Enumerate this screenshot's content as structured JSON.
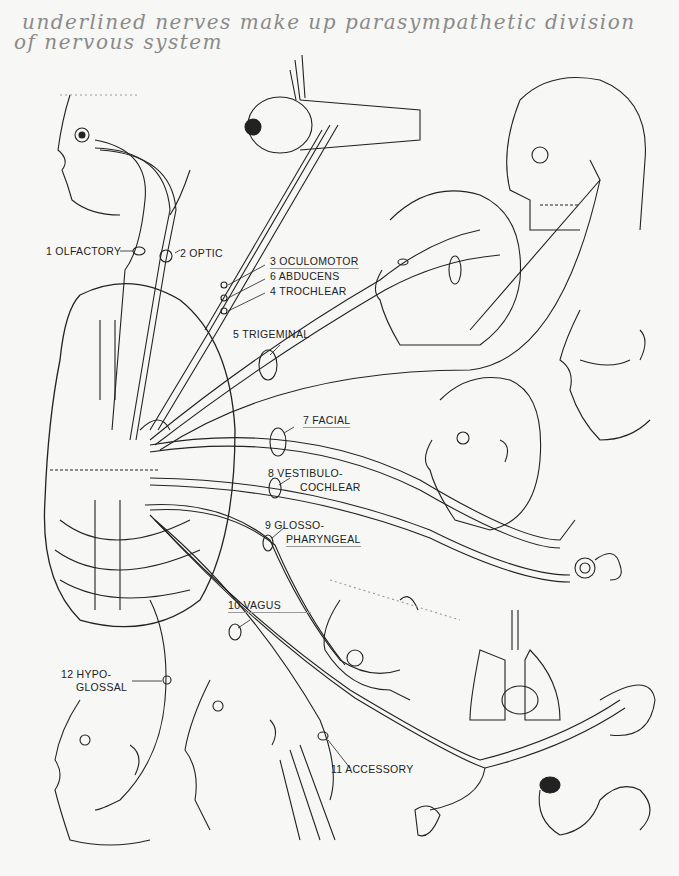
{
  "handwritten_note": {
    "line1": "underlined nerves make up parasympathetic division",
    "line2": "of nervous system",
    "color": "#8a8a8a"
  },
  "diagram": {
    "central_structure": "brain-inferior-view",
    "ink_color": "#222222",
    "background": "#f7f7f5"
  },
  "nerves": [
    {
      "number": "1",
      "name": "OLFACTORY",
      "label": "1 OLFACTORY",
      "underlined": false,
      "target": "nose"
    },
    {
      "number": "2",
      "name": "OPTIC",
      "label": "2 OPTIC",
      "underlined": false,
      "target": "eye"
    },
    {
      "number": "3",
      "name": "OCULOMOTOR",
      "label": "3 OCULOMOTOR",
      "underlined": true,
      "target": "eye-muscles"
    },
    {
      "number": "6",
      "name": "ABDUCENS",
      "label": "6 ABDUCENS",
      "underlined": false,
      "target": "eye-muscles"
    },
    {
      "number": "4",
      "name": "TROCHLEAR",
      "label": "4 TROCHLEAR",
      "underlined": false,
      "target": "eye-muscles"
    },
    {
      "number": "5",
      "name": "TRIGEMINAL",
      "label": "5 TRIGEMINAL",
      "underlined": false,
      "target": "face-jaw"
    },
    {
      "number": "7",
      "name": "FACIAL",
      "label": "7 FACIAL",
      "underlined": true,
      "target": "facial-muscles"
    },
    {
      "number": "8",
      "name": "VESTIBULOCOCHLEAR",
      "label_line1": "8 VESTIBULO-",
      "label_line2": "COCHLEAR",
      "underlined": false,
      "target": "inner-ear"
    },
    {
      "number": "9",
      "name": "GLOSSOPHARYNGEAL",
      "label_line1": "9 GLOSSO-",
      "label_line2": "PHARYNGEAL",
      "underlined": true,
      "target": "tongue-pharynx"
    },
    {
      "number": "10",
      "name": "VAGUS",
      "label": "10 VAGUS",
      "underlined": true,
      "target": "thoracic-abdominal-organs"
    },
    {
      "number": "11",
      "name": "ACCESSORY",
      "label": "11 ACCESSORY",
      "underlined": false,
      "target": "neck-muscles"
    },
    {
      "number": "12",
      "name": "HYPOGLOSSAL",
      "label_line1": "12 HYPO-",
      "label_line2": "GLOSSAL",
      "underlined": false,
      "target": "tongue"
    }
  ]
}
